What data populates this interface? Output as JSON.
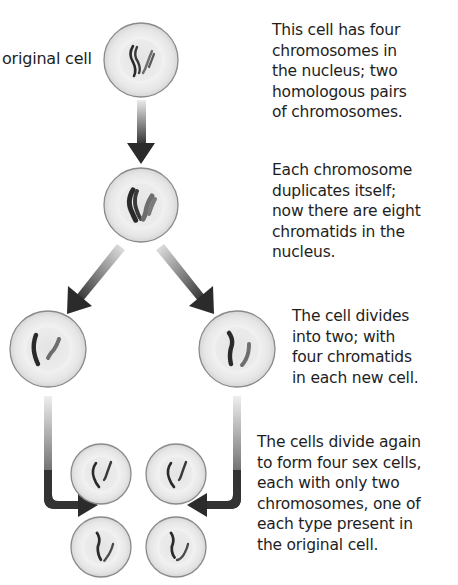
{
  "diagram": {
    "title": "",
    "original_cell_label": "original cell",
    "steps": [
      {
        "id": "step-1",
        "lines": [
          "This cell has four",
          "chromosomes in",
          "the nucleus; two",
          "homologous pairs",
          "of chromosomes."
        ]
      },
      {
        "id": "step-2",
        "lines": [
          "Each chromosome",
          "duplicates itself;",
          "now there are eight",
          "chromatids in the",
          "nucleus."
        ]
      },
      {
        "id": "step-3",
        "lines": [
          "The cell divides",
          "into two; with",
          "four chromatids",
          "in each new cell."
        ]
      },
      {
        "id": "step-4",
        "lines": [
          "The cells divide again",
          "to form four sex cells,",
          "each with only two",
          "chromosomes, one of",
          "each type present in",
          "the original cell."
        ]
      }
    ],
    "cells": [
      {
        "name": "original-cell",
        "cx": 141,
        "cy": 60,
        "r": 37,
        "chromosomes": 4
      },
      {
        "name": "duplicated-cell",
        "cx": 141,
        "cy": 205,
        "r": 37,
        "chromatids": 8
      },
      {
        "name": "daughter-cell-left",
        "cx": 48,
        "cy": 349,
        "r": 38,
        "chromatids": 4
      },
      {
        "name": "daughter-cell-right",
        "cx": 237,
        "cy": 349,
        "r": 38,
        "chromatids": 4
      },
      {
        "name": "sex-cell-top-left",
        "cx": 101,
        "cy": 474,
        "r": 30,
        "chromosomes": 2
      },
      {
        "name": "sex-cell-top-right",
        "cx": 176,
        "cy": 474,
        "r": 30,
        "chromosomes": 2
      },
      {
        "name": "sex-cell-bottom-left",
        "cx": 101,
        "cy": 547,
        "r": 30,
        "chromosomes": 2
      },
      {
        "name": "sex-cell-bottom-right",
        "cx": 176,
        "cy": 547,
        "r": 30,
        "chromosomes": 2
      }
    ],
    "colors": {
      "cell_outline": "#8a8a8a",
      "cell_fill": "#e9e9e9",
      "nucleus_fill": "#dcdcdc",
      "chromosome_dark": "#2a2a2a",
      "chromosome_light": "#6e6e6e",
      "arrow_dark": "#2b2b2b",
      "arrow_light": "#e2e2e2",
      "text": "#1e1e1e"
    }
  }
}
